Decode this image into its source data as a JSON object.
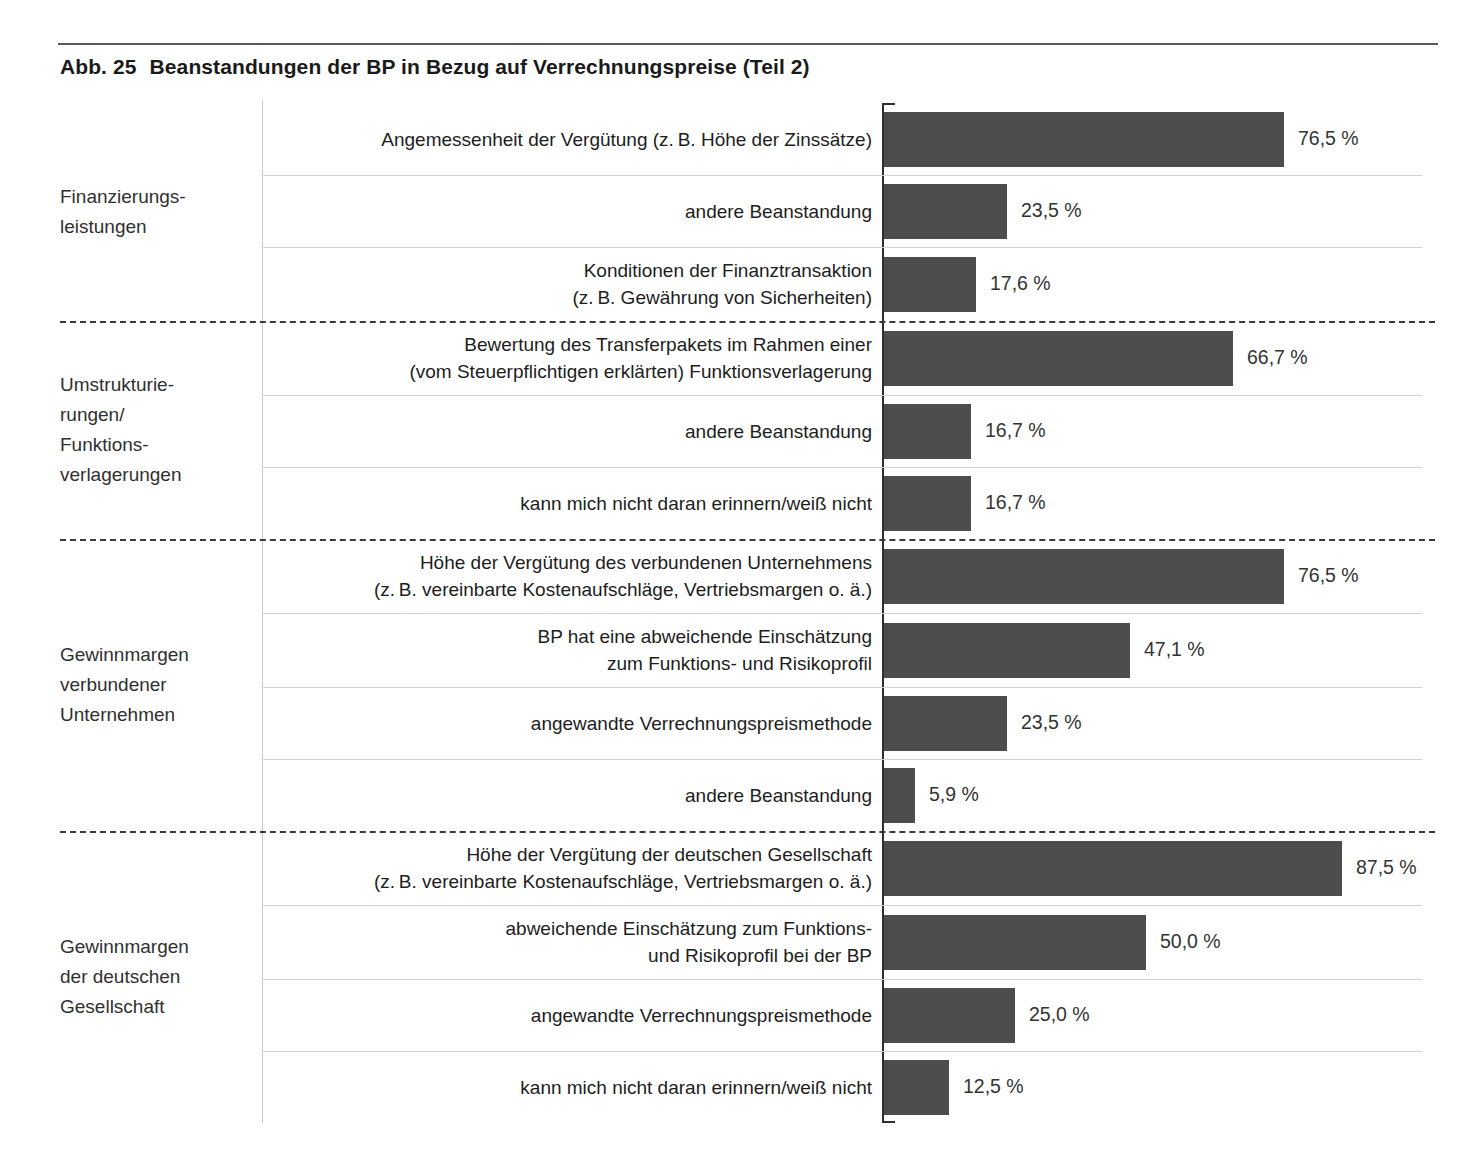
{
  "figure": {
    "number": "Abb. 25",
    "title": "Beanstandungen der BP in Bezug auf Verrechnungspreise (Teil 2)"
  },
  "chart_data": {
    "type": "bar",
    "orientation": "horizontal",
    "xlabel": "",
    "ylabel": "",
    "xlim": [
      0,
      100
    ],
    "grid": false,
    "legend": "none",
    "value_suffix": "%",
    "decimal_separator": ",",
    "bar_color": "#4d4d4d",
    "groups": [
      {
        "name": "Finanzierungs-leistungen",
        "label_lines": [
          "Finanzierungs-",
          "leistungen"
        ],
        "categories": [
          {
            "label_lines": [
              "Angemessenheit der Vergütung (z. B. Höhe der Zinssätze)"
            ],
            "label": "Angemessenheit der Vergütung (z. B. Höhe der Zinssätze)",
            "value": 76.5,
            "value_label": "76,5 %"
          },
          {
            "label_lines": [
              "andere Beanstandung"
            ],
            "label": "andere Beanstandung",
            "value": 23.5,
            "value_label": "23,5 %"
          },
          {
            "label_lines": [
              "Konditionen der Finanztransaktion",
              "(z. B. Gewährung von Sicherheiten)"
            ],
            "label": "Konditionen der Finanztransaktion (z. B. Gewährung von Sicherheiten)",
            "value": 17.6,
            "value_label": "17,6 %"
          }
        ]
      },
      {
        "name": "Umstrukturierungen/Funktionsverlagerungen",
        "label_lines": [
          "Umstrukturie-",
          "rungen/",
          "Funktions-",
          "verlagerungen"
        ],
        "categories": [
          {
            "label_lines": [
              "Bewertung des Transferpakets im Rahmen einer",
              "(vom Steuerpflichtigen erklärten) Funktionsverlagerung"
            ],
            "label": "Bewertung des Transferpakets im Rahmen einer (vom Steuerpflichtigen erklärten) Funktionsverlagerung",
            "value": 66.7,
            "value_label": "66,7 %"
          },
          {
            "label_lines": [
              "andere Beanstandung"
            ],
            "label": "andere Beanstandung",
            "value": 16.7,
            "value_label": "16,7 %"
          },
          {
            "label_lines": [
              "kann mich nicht daran erinnern/weiß nicht"
            ],
            "label": "kann mich nicht daran erinnern/weiß nicht",
            "value": 16.7,
            "value_label": "16,7 %"
          }
        ]
      },
      {
        "name": "Gewinnmargen verbundener Unternehmen",
        "label_lines": [
          "Gewinnmargen",
          "verbundener",
          "Unternehmen"
        ],
        "categories": [
          {
            "label_lines": [
              "Höhe der Vergütung des verbundenen Unternehmens",
              "(z. B. vereinbarte Kostenaufschläge, Vertriebsmargen o. ä.)"
            ],
            "label": "Höhe der Vergütung des verbundenen Unternehmens (z. B. vereinbarte Kostenaufschläge, Vertriebsmargen o. ä.)",
            "value": 76.5,
            "value_label": "76,5 %"
          },
          {
            "label_lines": [
              "BP hat eine abweichende Einschätzung",
              "zum Funktions- und Risikoprofil"
            ],
            "label": "BP hat eine abweichende Einschätzung zum Funktions- und Risikoprofil",
            "value": 47.1,
            "value_label": "47,1 %"
          },
          {
            "label_lines": [
              "angewandte Verrechnungspreismethode"
            ],
            "label": "angewandte Verrechnungspreismethode",
            "value": 23.5,
            "value_label": "23,5 %"
          },
          {
            "label_lines": [
              "andere Beanstandung"
            ],
            "label": "andere Beanstandung",
            "value": 5.9,
            "value_label": "5,9 %"
          }
        ]
      },
      {
        "name": "Gewinnmargen der deutschen Gesellschaft",
        "label_lines": [
          "Gewinnmargen",
          "der deutschen",
          "Gesellschaft"
        ],
        "categories": [
          {
            "label_lines": [
              "Höhe der Vergütung der deutschen Gesellschaft",
              "(z. B. vereinbarte Kostenaufschläge, Vertriebsmargen o. ä.)"
            ],
            "label": "Höhe der Vergütung der deutschen Gesellschaft (z. B. vereinbarte Kostenaufschläge, Vertriebsmargen o. ä.)",
            "value": 87.5,
            "value_label": "87,5 %"
          },
          {
            "label_lines": [
              "abweichende Einschätzung zum Funktions-",
              "und Risikoprofil bei der BP"
            ],
            "label": "abweichende Einschätzung zum Funktions- und Risikoprofil bei der BP",
            "value": 50.0,
            "value_label": "50,0 %"
          },
          {
            "label_lines": [
              "angewandte Verrechnungspreismethode"
            ],
            "label": "angewandte Verrechnungspreismethode",
            "value": 25.0,
            "value_label": "25,0 %"
          },
          {
            "label_lines": [
              "kann mich nicht daran erinnern/weiß nicht"
            ],
            "label": "kann mich nicht daran erinnern/weiß nicht",
            "value": 12.5,
            "value_label": "12,5 %"
          }
        ]
      }
    ]
  }
}
